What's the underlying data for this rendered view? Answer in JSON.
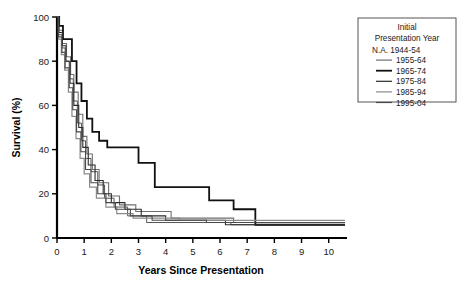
{
  "chart_data": {
    "type": "line",
    "subtype": "kaplan-meier-step",
    "title": "",
    "xlabel": "Years Since Presentation",
    "ylabel": "Survival (%)",
    "xlim": [
      0,
      10.6
    ],
    "ylim": [
      0,
      100
    ],
    "xticks": [
      0,
      1,
      2,
      3,
      4,
      5,
      6,
      7,
      8,
      9,
      10
    ],
    "yticks": [
      0,
      20,
      40,
      60,
      80,
      100
    ],
    "grid": false,
    "legend_position": "outside-right-top",
    "legend_title": [
      "Initial",
      "Presentation Year"
    ],
    "series": [
      {
        "name": "N.A. 1944-54",
        "has_swatch": false,
        "color": "#555555",
        "width": 1.0,
        "points": [
          [
            0,
            100
          ],
          [
            0.05,
            100
          ],
          [
            0.05,
            92
          ],
          [
            0.18,
            92
          ],
          [
            0.18,
            86
          ],
          [
            0.3,
            86
          ],
          [
            0.3,
            80
          ],
          [
            0.45,
            80
          ],
          [
            0.45,
            72
          ],
          [
            0.6,
            72
          ],
          [
            0.6,
            62
          ],
          [
            0.75,
            62
          ],
          [
            0.75,
            52
          ],
          [
            0.9,
            52
          ],
          [
            0.9,
            44
          ],
          [
            1.05,
            44
          ],
          [
            1.05,
            36
          ],
          [
            1.25,
            36
          ],
          [
            1.25,
            30
          ],
          [
            1.5,
            30
          ],
          [
            1.5,
            24
          ],
          [
            1.75,
            24
          ],
          [
            1.75,
            18
          ],
          [
            2.1,
            18
          ],
          [
            2.1,
            14
          ],
          [
            2.6,
            14
          ],
          [
            2.6,
            10
          ],
          [
            3.3,
            10
          ],
          [
            3.3,
            7
          ],
          [
            6.4,
            7
          ],
          [
            6.4,
            6
          ],
          [
            10.6,
            6
          ]
        ]
      },
      {
        "name": "1955-64",
        "has_swatch": true,
        "color": "#6f6f6f",
        "width": 1.1,
        "points": [
          [
            0,
            100
          ],
          [
            0.06,
            100
          ],
          [
            0.06,
            94
          ],
          [
            0.2,
            94
          ],
          [
            0.2,
            88
          ],
          [
            0.35,
            88
          ],
          [
            0.35,
            82
          ],
          [
            0.5,
            82
          ],
          [
            0.5,
            74
          ],
          [
            0.62,
            74
          ],
          [
            0.62,
            66
          ],
          [
            0.78,
            66
          ],
          [
            0.78,
            56
          ],
          [
            0.95,
            56
          ],
          [
            0.95,
            46
          ],
          [
            1.1,
            46
          ],
          [
            1.1,
            38
          ],
          [
            1.3,
            38
          ],
          [
            1.3,
            31
          ],
          [
            1.55,
            31
          ],
          [
            1.55,
            25
          ],
          [
            1.9,
            25
          ],
          [
            1.9,
            19
          ],
          [
            2.3,
            19
          ],
          [
            2.3,
            15
          ],
          [
            2.9,
            15
          ],
          [
            2.9,
            12
          ],
          [
            4.2,
            12
          ],
          [
            4.2,
            9
          ],
          [
            6.5,
            9
          ],
          [
            6.5,
            7
          ],
          [
            10.6,
            7
          ]
        ]
      },
      {
        "name": "1965-74",
        "has_swatch": true,
        "color": "#111111",
        "width": 1.8,
        "points": [
          [
            0,
            100
          ],
          [
            0.08,
            100
          ],
          [
            0.08,
            96
          ],
          [
            0.22,
            96
          ],
          [
            0.22,
            90
          ],
          [
            0.4,
            90
          ],
          [
            0.4,
            90
          ],
          [
            0.55,
            90
          ],
          [
            0.55,
            80
          ],
          [
            0.72,
            80
          ],
          [
            0.72,
            70
          ],
          [
            0.9,
            70
          ],
          [
            0.9,
            62
          ],
          [
            1.1,
            62
          ],
          [
            1.1,
            54
          ],
          [
            1.3,
            54
          ],
          [
            1.3,
            48
          ],
          [
            1.55,
            48
          ],
          [
            1.55,
            44
          ],
          [
            1.85,
            44
          ],
          [
            1.85,
            41
          ],
          [
            2.35,
            41
          ],
          [
            2.35,
            41
          ],
          [
            3.0,
            41
          ],
          [
            3.0,
            34
          ],
          [
            3.6,
            34
          ],
          [
            3.6,
            23
          ],
          [
            5.0,
            23
          ],
          [
            5.0,
            23
          ],
          [
            5.6,
            23
          ],
          [
            5.6,
            17
          ],
          [
            6.5,
            17
          ],
          [
            6.5,
            13
          ],
          [
            7.3,
            13
          ],
          [
            7.3,
            6
          ],
          [
            10.6,
            6
          ]
        ]
      },
      {
        "name": "1975-84",
        "has_swatch": true,
        "color": "#2b2b2b",
        "width": 1.1,
        "points": [
          [
            0,
            100
          ],
          [
            0.07,
            100
          ],
          [
            0.07,
            93
          ],
          [
            0.2,
            93
          ],
          [
            0.2,
            87
          ],
          [
            0.33,
            87
          ],
          [
            0.33,
            80
          ],
          [
            0.48,
            80
          ],
          [
            0.48,
            70
          ],
          [
            0.62,
            70
          ],
          [
            0.62,
            60
          ],
          [
            0.8,
            60
          ],
          [
            0.8,
            50
          ],
          [
            0.95,
            50
          ],
          [
            0.95,
            41
          ],
          [
            1.15,
            41
          ],
          [
            1.15,
            33
          ],
          [
            1.4,
            33
          ],
          [
            1.4,
            26
          ],
          [
            1.7,
            26
          ],
          [
            1.7,
            20
          ],
          [
            2.0,
            20
          ],
          [
            2.0,
            16
          ],
          [
            2.5,
            16
          ],
          [
            2.5,
            13
          ],
          [
            3.1,
            13
          ],
          [
            3.1,
            10
          ],
          [
            4.0,
            10
          ],
          [
            4.0,
            8
          ],
          [
            6.2,
            8
          ],
          [
            6.2,
            6
          ],
          [
            10.6,
            6
          ]
        ]
      },
      {
        "name": "1985-94",
        "has_swatch": true,
        "color": "#8a8a8a",
        "width": 1.2,
        "points": [
          [
            0,
            100
          ],
          [
            0.05,
            100
          ],
          [
            0.05,
            90
          ],
          [
            0.16,
            90
          ],
          [
            0.16,
            83
          ],
          [
            0.28,
            83
          ],
          [
            0.28,
            76
          ],
          [
            0.42,
            76
          ],
          [
            0.42,
            66
          ],
          [
            0.55,
            66
          ],
          [
            0.55,
            55
          ],
          [
            0.7,
            55
          ],
          [
            0.7,
            45
          ],
          [
            0.85,
            45
          ],
          [
            0.85,
            36
          ],
          [
            1.0,
            36
          ],
          [
            1.0,
            29
          ],
          [
            1.2,
            29
          ],
          [
            1.2,
            23
          ],
          [
            1.45,
            23
          ],
          [
            1.45,
            18
          ],
          [
            1.8,
            18
          ],
          [
            1.8,
            14
          ],
          [
            2.2,
            14
          ],
          [
            2.2,
            11
          ],
          [
            2.8,
            11
          ],
          [
            2.8,
            9
          ],
          [
            4.5,
            9
          ],
          [
            4.5,
            8
          ],
          [
            6.3,
            8
          ],
          [
            6.3,
            8
          ],
          [
            10.6,
            8
          ]
        ]
      },
      {
        "name": "1995-04",
        "has_swatch": true,
        "color": "#4a4a4a",
        "width": 1.1,
        "points": [
          [
            0,
            100
          ],
          [
            0.06,
            100
          ],
          [
            0.06,
            91
          ],
          [
            0.18,
            91
          ],
          [
            0.18,
            84
          ],
          [
            0.3,
            84
          ],
          [
            0.3,
            77
          ],
          [
            0.45,
            77
          ],
          [
            0.45,
            68
          ],
          [
            0.58,
            68
          ],
          [
            0.58,
            58
          ],
          [
            0.72,
            58
          ],
          [
            0.72,
            48
          ],
          [
            0.88,
            48
          ],
          [
            0.88,
            39
          ],
          [
            1.05,
            39
          ],
          [
            1.05,
            31
          ],
          [
            1.25,
            31
          ],
          [
            1.25,
            25
          ],
          [
            1.5,
            25
          ],
          [
            1.5,
            20
          ],
          [
            1.8,
            20
          ],
          [
            1.8,
            16
          ],
          [
            2.15,
            16
          ],
          [
            2.15,
            13
          ],
          [
            2.7,
            13
          ],
          [
            2.7,
            10
          ],
          [
            3.5,
            10
          ],
          [
            3.5,
            8
          ],
          [
            5.5,
            8
          ],
          [
            5.5,
            7
          ],
          [
            10.6,
            7
          ]
        ]
      }
    ]
  }
}
